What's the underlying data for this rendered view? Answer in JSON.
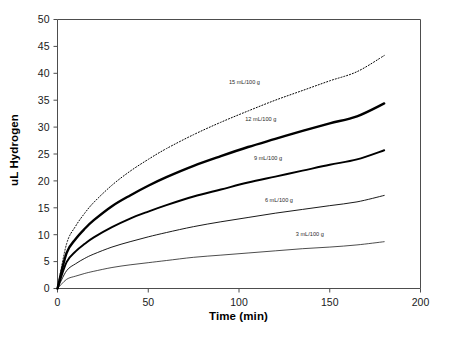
{
  "chart_data": {
    "type": "line",
    "title": "",
    "xlabel": "Time (min)",
    "ylabel": "uL Hydrogen",
    "xlim": [
      0,
      200
    ],
    "ylim": [
      0,
      50
    ],
    "xticks": [
      0,
      50,
      100,
      150,
      200
    ],
    "yticks": [
      0,
      5,
      10,
      15,
      20,
      25,
      30,
      35,
      40,
      45,
      50
    ],
    "xtick_labels": [
      "0",
      "50",
      "100",
      "150",
      "200"
    ],
    "ytick_labels": [
      "0",
      "5",
      "10",
      "15",
      "20",
      "25",
      "30",
      "35",
      "40",
      "45",
      "50"
    ],
    "grid": false,
    "legend_position": "inline-annotations",
    "x": [
      0,
      5,
      10,
      15,
      20,
      30,
      40,
      50,
      60,
      75,
      90,
      105,
      120,
      135,
      150,
      165,
      180
    ],
    "series": [
      {
        "name": "15 mL/100 g",
        "label": "15 mL/100 g",
        "style": "dotted",
        "line_width": 1.0,
        "color": "#000000",
        "label_x": 103,
        "label_y": 38.0,
        "values": [
          0,
          8.3,
          11.6,
          14.0,
          16.0,
          19.2,
          21.8,
          24.0,
          26.0,
          28.6,
          30.9,
          33.0,
          35.0,
          36.8,
          38.6,
          40.3,
          43.3
        ]
      },
      {
        "name": "12 mL/100 g",
        "label": "12 mL/100 g",
        "style": "solid",
        "line_width": 2.4,
        "color": "#000000",
        "label_x": 112,
        "label_y": 31.2,
        "values": [
          0,
          6.6,
          9.2,
          11.1,
          12.7,
          15.3,
          17.3,
          19.1,
          20.7,
          22.8,
          24.6,
          26.3,
          27.8,
          29.3,
          30.7,
          32.0,
          34.4
        ]
      },
      {
        "name": "9 mL/100 g",
        "label": "9 mL/100 g",
        "style": "solid",
        "line_width": 1.9,
        "color": "#000000",
        "label_x": 116,
        "label_y": 23.8,
        "values": [
          0,
          4.9,
          6.9,
          8.3,
          9.5,
          11.4,
          13.0,
          14.3,
          15.5,
          17.1,
          18.4,
          19.7,
          20.8,
          21.9,
          23.0,
          24.0,
          25.7
        ]
      },
      {
        "name": "6 mL/100 g",
        "label": "6 mL/100 g",
        "style": "solid",
        "line_width": 0.9,
        "color": "#000000",
        "label_x": 122,
        "label_y": 16.0,
        "values": [
          0,
          3.3,
          4.6,
          5.6,
          6.4,
          7.7,
          8.7,
          9.6,
          10.4,
          11.5,
          12.4,
          13.2,
          14.0,
          14.7,
          15.4,
          16.1,
          17.3
        ]
      },
      {
        "name": "3 mL/100 g",
        "label": "3 mL/100 g",
        "style": "solid",
        "line_width": 0.7,
        "color": "#6b6b6b",
        "label_x": 139,
        "label_y": 9.8,
        "values": [
          0,
          1.7,
          2.3,
          2.8,
          3.2,
          3.9,
          4.4,
          4.8,
          5.2,
          5.8,
          6.2,
          6.6,
          7.0,
          7.4,
          7.7,
          8.1,
          8.7
        ]
      }
    ]
  },
  "axes": {
    "y_title": "uL Hydrogen",
    "x_title": "Time (min)"
  }
}
